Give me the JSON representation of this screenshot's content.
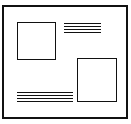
{
  "diagram": {
    "frame": {
      "stroke": "#111111",
      "fill": "#ffffff"
    },
    "elements": [
      {
        "type": "image-placeholder",
        "position": "top-left"
      },
      {
        "type": "text-placeholder",
        "position": "top-right",
        "line_count": 4
      },
      {
        "type": "image-placeholder",
        "position": "bottom-right"
      },
      {
        "type": "text-placeholder",
        "position": "bottom-left",
        "line_count": 4
      }
    ]
  }
}
